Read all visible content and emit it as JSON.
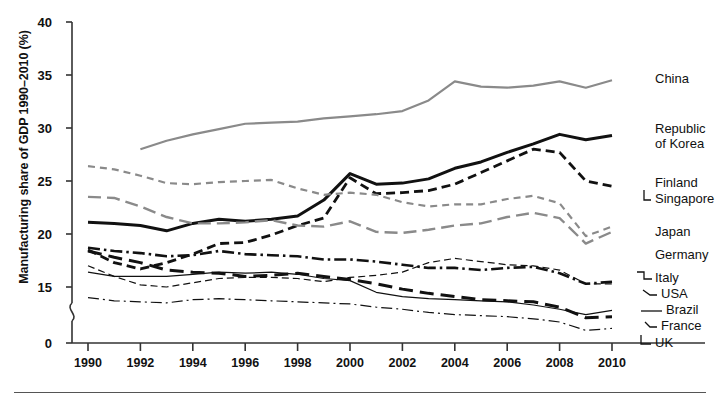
{
  "axes": {
    "ylabel": "Manufacturing share of GDP 1990–2010 (%)",
    "yticks": [
      "40",
      "35",
      "30",
      "25",
      "20",
      "15",
      "0"
    ],
    "xticks": [
      "1990",
      "1992",
      "1994",
      "1996",
      "1998",
      "2000",
      "2002",
      "2004",
      "2006",
      "2008",
      "2010"
    ],
    "ylim": [
      0,
      40
    ],
    "xlim": [
      1990,
      2010
    ],
    "axis_break": true,
    "grid": false
  },
  "labels": {
    "china": "China",
    "korea_line1": "Republic",
    "korea_line2": "of Korea",
    "finland": "Finland",
    "singapore": "Singapore",
    "japan": "Japan",
    "germany": "Germany",
    "italy": "Italy",
    "usa": "USA",
    "brazil": "Brazil",
    "france": "France",
    "uk": "UK"
  },
  "colors": {
    "dark": "#111111",
    "gray": "#8a8a8a",
    "axis": "#333333",
    "rule": "#555555",
    "background": "#ffffff"
  },
  "chart_data": {
    "type": "line",
    "title": "",
    "xlabel": "",
    "ylabel": "Manufacturing share of GDP 1990–2010 (%)",
    "xlim": [
      1990,
      2010
    ],
    "ylim": [
      0,
      40
    ],
    "grid": false,
    "legend_position": "right-inline",
    "x": [
      1990,
      1991,
      1992,
      1993,
      1994,
      1995,
      1996,
      1997,
      1998,
      1999,
      2000,
      2001,
      2002,
      2003,
      2004,
      2005,
      2006,
      2007,
      2008,
      2009,
      2010
    ],
    "series": [
      {
        "name": "China",
        "style": "solid",
        "color": "#8a8a8a",
        "width": 2.2,
        "values": [
          null,
          null,
          28.0,
          28.8,
          29.4,
          29.9,
          30.4,
          30.5,
          30.6,
          30.9,
          31.1,
          31.3,
          31.6,
          32.6,
          34.4,
          33.9,
          33.8,
          34.0,
          34.4,
          33.8,
          34.5
        ]
      },
      {
        "name": "Republic of Korea",
        "style": "solid",
        "color": "#111111",
        "width": 3.0,
        "values": [
          21.1,
          21.0,
          20.8,
          20.3,
          21.0,
          21.4,
          21.2,
          21.4,
          21.7,
          23.2,
          25.7,
          24.7,
          24.8,
          25.2,
          26.2,
          26.8,
          27.7,
          28.5,
          29.4,
          28.9,
          29.3
        ]
      },
      {
        "name": "Finland / Singapore",
        "style": "dashed",
        "color": "#111111",
        "width": 2.8,
        "values": [
          18.5,
          17.3,
          16.7,
          17.3,
          18.1,
          19.1,
          19.2,
          19.9,
          20.8,
          21.5,
          25.3,
          23.8,
          23.9,
          24.1,
          24.7,
          25.8,
          26.9,
          28.0,
          27.7,
          25.0,
          24.5
        ]
      },
      {
        "name": "Japan",
        "style": "long-dash",
        "color": "#8a8a8a",
        "width": 2.4,
        "values": [
          23.5,
          23.4,
          22.6,
          21.6,
          21.0,
          21.0,
          21.1,
          21.3,
          20.8,
          20.7,
          21.2,
          20.2,
          20.1,
          20.4,
          20.8,
          21.0,
          21.6,
          22.0,
          21.5,
          19.1,
          20.2
        ]
      },
      {
        "name": "Germany",
        "style": "short-dash",
        "color": "#8a8a8a",
        "width": 2.2,
        "values": [
          26.4,
          26.1,
          25.5,
          24.8,
          24.7,
          24.9,
          25.0,
          25.1,
          24.3,
          23.7,
          23.9,
          23.7,
          23.0,
          22.6,
          22.8,
          22.8,
          23.3,
          23.6,
          22.9,
          19.8,
          20.7
        ]
      },
      {
        "name": "Italy",
        "style": "dash-dot",
        "color": "#111111",
        "width": 2.6,
        "values": [
          18.7,
          18.4,
          18.2,
          17.9,
          18.0,
          18.4,
          18.1,
          18.0,
          17.9,
          17.6,
          17.6,
          17.4,
          17.1,
          16.8,
          16.8,
          16.6,
          16.8,
          16.9,
          16.3,
          15.3,
          15.5
        ]
      },
      {
        "name": "USA",
        "style": "thin-solid",
        "color": "#111111",
        "width": 1.2,
        "values": [
          16.4,
          16.0,
          16.0,
          16.0,
          16.2,
          16.4,
          16.3,
          16.4,
          16.2,
          15.8,
          15.6,
          14.5,
          14.1,
          13.9,
          13.8,
          13.7,
          13.6,
          13.3,
          12.9,
          12.4,
          12.8
        ]
      },
      {
        "name": "Brazil",
        "style": "thin-dash",
        "color": "#111111",
        "width": 1.2,
        "values": [
          17.0,
          16.0,
          15.2,
          15.0,
          15.4,
          15.8,
          15.9,
          15.9,
          15.8,
          15.5,
          15.9,
          16.1,
          16.4,
          17.3,
          17.7,
          17.4,
          17.1,
          17.0,
          16.6,
          15.3,
          15.3
        ]
      },
      {
        "name": "France",
        "style": "long-dash-thick",
        "color": "#111111",
        "width": 3.0,
        "values": [
          18.4,
          17.8,
          17.3,
          16.6,
          16.4,
          16.3,
          16.0,
          16.1,
          16.3,
          16.0,
          15.7,
          15.3,
          14.8,
          14.4,
          14.1,
          13.8,
          13.7,
          13.6,
          13.1,
          12.1,
          12.2
        ]
      },
      {
        "name": "UK",
        "style": "thin-dash-dot",
        "color": "#111111",
        "width": 1.2,
        "values": [
          14.0,
          13.7,
          13.6,
          13.5,
          13.8,
          13.9,
          13.8,
          13.7,
          13.6,
          13.5,
          13.4,
          13.1,
          12.9,
          12.6,
          12.4,
          12.3,
          12.2,
          12.0,
          11.7,
          10.9,
          11.1
        ]
      }
    ]
  }
}
